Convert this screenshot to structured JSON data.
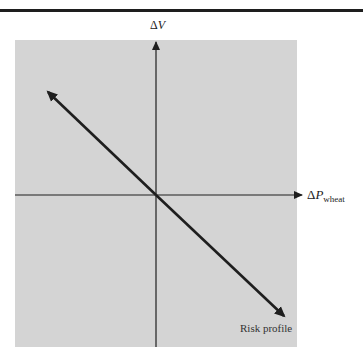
{
  "diagram": {
    "y_axis": {
      "delta": "Δ",
      "variable": "V"
    },
    "x_axis": {
      "delta": "Δ",
      "variable": "P",
      "subscript": "wheat"
    },
    "curve_label": "Risk profile",
    "colors": {
      "panel": "#d4d4d4",
      "lines": "#1e1e1e",
      "rule": "#1e1e1e"
    },
    "curve": {
      "type": "line",
      "slope": "negative",
      "through_origin": true
    }
  }
}
